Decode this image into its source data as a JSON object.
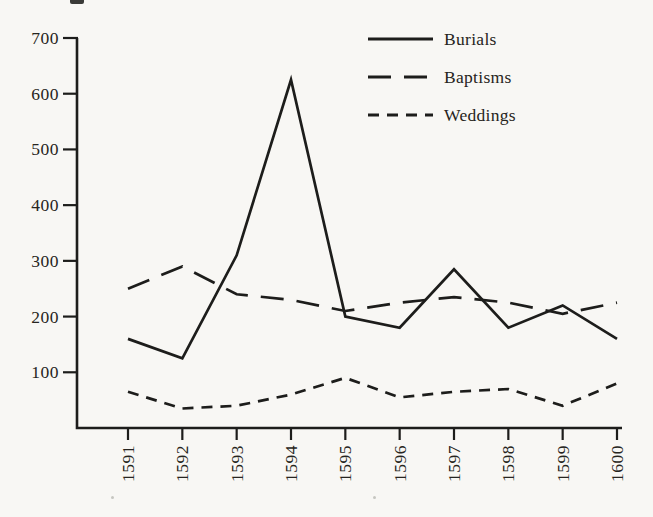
{
  "figure": {
    "paper_color": "#f8f7f4",
    "ink_color": "#1d1d1b"
  },
  "chart_data": {
    "type": "line",
    "title": "",
    "xlabel": "",
    "ylabel": "",
    "categories": [
      "1591",
      "1592",
      "1593",
      "1594",
      "1595",
      "1596",
      "1597",
      "1598",
      "1599",
      "1600"
    ],
    "series": [
      {
        "name": "Burials",
        "line_style": "solid",
        "values": [
          160,
          125,
          310,
          625,
          200,
          180,
          285,
          180,
          220,
          160
        ]
      },
      {
        "name": "Baptisms",
        "line_style": "long-dash",
        "values": [
          250,
          290,
          240,
          230,
          210,
          225,
          235,
          225,
          205,
          225
        ]
      },
      {
        "name": "Weddings",
        "line_style": "short-dash",
        "values": [
          65,
          35,
          40,
          60,
          90,
          55,
          65,
          70,
          40,
          80
        ]
      }
    ],
    "ylim": [
      0,
      700
    ],
    "yticks": [
      100,
      200,
      300,
      400,
      500,
      600,
      700
    ],
    "grid": false,
    "legend_position": "top-right",
    "x_tick_label_rotation": -90
  }
}
